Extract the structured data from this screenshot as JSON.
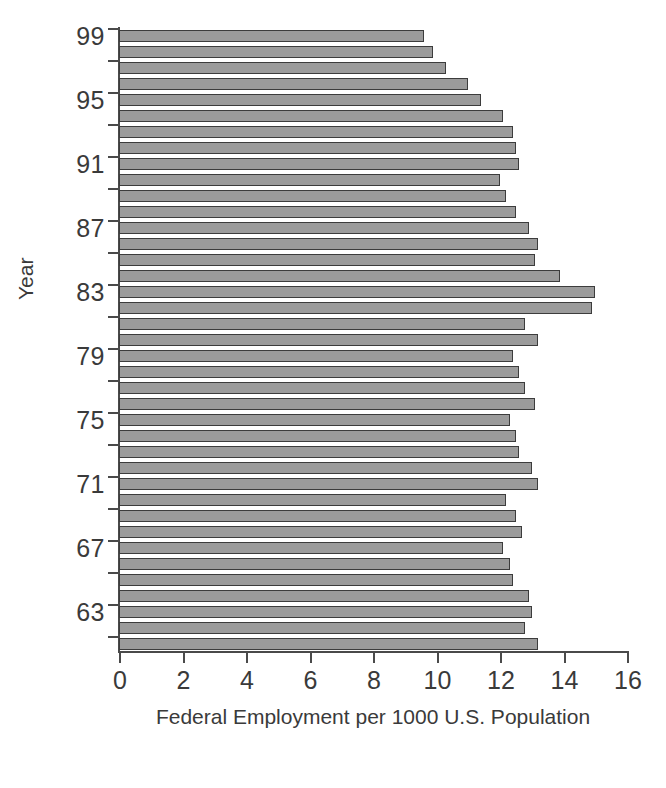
{
  "chart_data": {
    "type": "bar",
    "orientation": "horizontal",
    "title": "",
    "xlabel": "Federal Employment per 1000 U.S. Population",
    "ylabel": "Year",
    "xlim": [
      0,
      16
    ],
    "ylim_labels": [
      99,
      61
    ],
    "xticks": [
      0,
      2,
      4,
      6,
      8,
      10,
      12,
      14,
      16
    ],
    "xtick_labels": [
      "0",
      "2",
      "4",
      "6",
      "8",
      "10",
      "12",
      "14",
      "16"
    ],
    "yticks": [
      99,
      95,
      91,
      87,
      83,
      79,
      75,
      71,
      67,
      63
    ],
    "ytick_labels": [
      "99",
      "95",
      "91",
      "87",
      "83",
      "79",
      "75",
      "71",
      "67",
      "63"
    ],
    "grid": false,
    "legend": false,
    "bar_color": "#9b9b9b",
    "bar_edge_color": "#3c3c3c",
    "axis_color": "#4a4a4a",
    "categories": [
      "99",
      "98",
      "97",
      "96",
      "95",
      "94",
      "93",
      "92",
      "91",
      "90",
      "89",
      "88",
      "87",
      "86",
      "85",
      "84",
      "83",
      "82",
      "81",
      "80",
      "79",
      "78",
      "77",
      "76",
      "75",
      "74",
      "73",
      "72",
      "71",
      "70",
      "69",
      "68",
      "67",
      "66",
      "65",
      "64",
      "63",
      "62",
      "61"
    ],
    "values": [
      9.6,
      9.9,
      10.3,
      11.0,
      11.4,
      12.1,
      12.4,
      12.5,
      12.6,
      12.0,
      12.2,
      12.5,
      12.9,
      13.2,
      13.1,
      13.9,
      15.0,
      14.9,
      12.8,
      13.2,
      12.4,
      12.6,
      12.8,
      13.1,
      12.3,
      12.5,
      12.6,
      13.0,
      13.2,
      12.2,
      12.5,
      12.7,
      12.1,
      12.3,
      12.4,
      12.9,
      13.0,
      12.8,
      13.2
    ]
  }
}
